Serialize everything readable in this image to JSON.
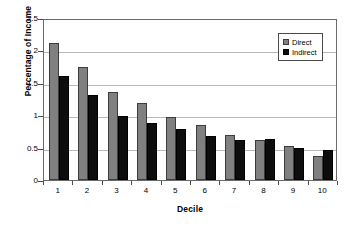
{
  "chart_data": {
    "type": "bar",
    "title": "",
    "xlabel": "Decile",
    "ylabel": "Percentage of Income",
    "categories": [
      "1",
      "2",
      "3",
      "4",
      "5",
      "6",
      "7",
      "8",
      "9",
      "10"
    ],
    "series": [
      {
        "name": "Direct",
        "color": "#808080",
        "values": [
          2.12,
          1.74,
          1.36,
          1.19,
          0.97,
          0.85,
          0.69,
          0.61,
          0.53,
          0.37
        ]
      },
      {
        "name": "Indirect",
        "color": "#0d0d0d",
        "values": [
          1.6,
          1.31,
          0.99,
          0.88,
          0.78,
          0.68,
          0.61,
          0.63,
          0.49,
          0.46
        ]
      }
    ],
    "ylim": [
      0,
      2.5
    ],
    "yticks": [
      0,
      0.5,
      1,
      1.5,
      2,
      2.5
    ],
    "ytick_labels": [
      "0",
      "0.5",
      "1",
      "1.5",
      "2",
      "2.5"
    ],
    "grid": "horizontal",
    "legend_position": "top-right"
  },
  "legend": {
    "entries": [
      {
        "label": "Direct"
      },
      {
        "label": "Indirect"
      }
    ]
  }
}
